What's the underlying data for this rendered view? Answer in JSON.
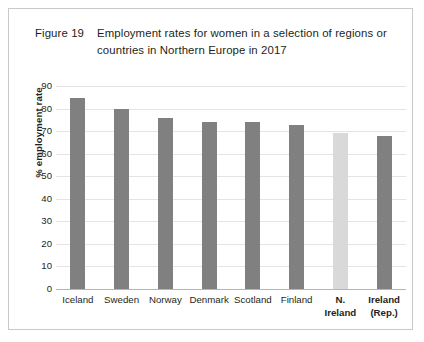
{
  "figure": {
    "label": "Figure 19",
    "caption_line1": "Employment rates for women in a selection of regions or",
    "caption_line2": "countries in Northern Europe in 2017"
  },
  "colors": {
    "bar_default": "#808080",
    "bar_highlight": "#d9d9d9",
    "gridline": "#e4e4e4",
    "axis": "#b5b5b5",
    "frame": "#c9c9c9",
    "text": "#231f20"
  },
  "chart_data": {
    "type": "bar",
    "title": "Employment rates for women in a selection of regions or countries in Northern Europe in 2017",
    "xlabel": "",
    "ylabel": "% employment rate",
    "ylim": [
      0,
      90
    ],
    "ytick_step": 10,
    "yticks": [
      90,
      80,
      70,
      60,
      50,
      40,
      30,
      20,
      10,
      0
    ],
    "grid": true,
    "legend": "none",
    "categories": [
      "Iceland",
      "Sweden",
      "Norway",
      "Denmark",
      "Scotland",
      "Finland",
      "N. Ireland",
      "Ireland (Rep.)"
    ],
    "category_lines": [
      [
        "Iceland"
      ],
      [
        "Sweden"
      ],
      [
        "Norway"
      ],
      [
        "Denmark"
      ],
      [
        "Scotland"
      ],
      [
        "Finland"
      ],
      [
        "N.",
        "Ireland"
      ],
      [
        "Ireland",
        "(Rep.)"
      ]
    ],
    "category_emphasis": [
      false,
      false,
      false,
      false,
      false,
      false,
      true,
      true
    ],
    "values": [
      84.5,
      80,
      76,
      74,
      74,
      72.5,
      69,
      68
    ],
    "bar_colors": [
      "#808080",
      "#808080",
      "#808080",
      "#808080",
      "#808080",
      "#808080",
      "#d9d9d9",
      "#808080"
    ]
  }
}
